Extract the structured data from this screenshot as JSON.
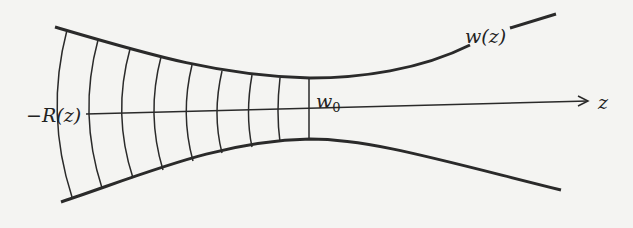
{
  "diagram": {
    "labels": {
      "radius_of_curvature": "−R(z)",
      "beam_width": "w(z)",
      "waist": "w",
      "waist_sub": "0",
      "axis": "z"
    },
    "colors": {
      "line": "#2a2a2a",
      "background": "#f4f4f2"
    },
    "wavefront_count": 9
  }
}
